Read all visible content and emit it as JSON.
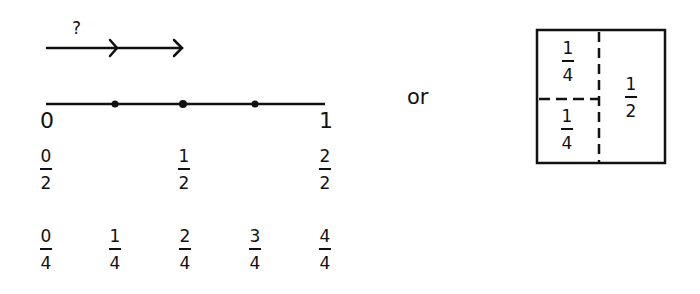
{
  "arrow": {
    "label": "?"
  },
  "number_line": {
    "start_label": "0",
    "end_label": "1",
    "halves": [
      {
        "num": "0",
        "den": "2"
      },
      {
        "num": "1",
        "den": "2"
      },
      {
        "num": "2",
        "den": "2"
      }
    ],
    "quarters": [
      {
        "num": "0",
        "den": "4"
      },
      {
        "num": "1",
        "den": "4"
      },
      {
        "num": "2",
        "den": "4"
      },
      {
        "num": "3",
        "den": "4"
      },
      {
        "num": "4",
        "den": "4"
      }
    ]
  },
  "connector": "or",
  "area_model": {
    "top_left": {
      "num": "1",
      "den": "4"
    },
    "bottom_left": {
      "num": "1",
      "den": "4"
    },
    "right": {
      "num": "1",
      "den": "2"
    }
  }
}
